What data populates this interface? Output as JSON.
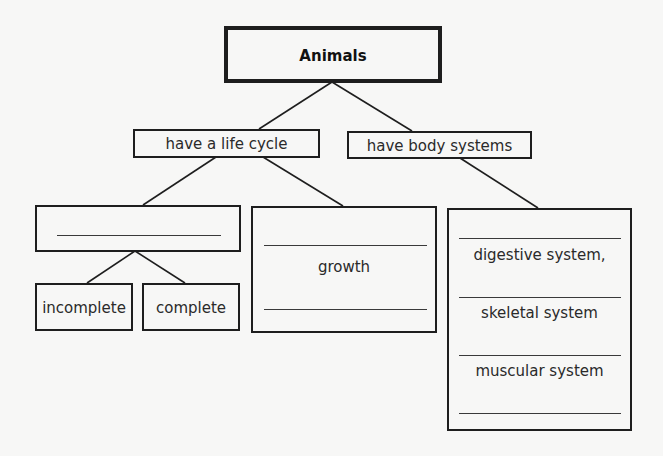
{
  "diagram": {
    "title": "Animals",
    "colors": {
      "background": "#f7f7f6",
      "stroke": "#1e1e1e",
      "text": "#2a2a2a"
    },
    "level1": [
      {
        "id": "life-cycle",
        "label": "have a life cycle"
      },
      {
        "id": "body-systems",
        "label": "have body systems"
      }
    ],
    "life_cycle_children": {
      "blank_box": {
        "label": "",
        "blank_lines": 1
      },
      "growth_box": {
        "label": "growth",
        "blank_lines": 2
      }
    },
    "metamorphosis_types": [
      {
        "label": "incomplete"
      },
      {
        "label": "complete"
      }
    ],
    "body_systems_box": {
      "items": [
        {
          "label": "digestive system,"
        },
        {
          "label": "skeletal system"
        },
        {
          "label": "muscular system"
        }
      ],
      "blank_lines": 4
    }
  }
}
